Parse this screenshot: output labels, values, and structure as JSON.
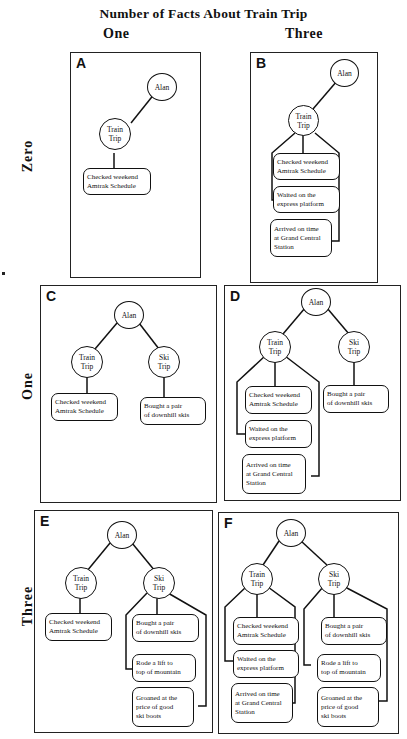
{
  "figure": {
    "title": "Number of Facts About Train Trip",
    "column_labels": [
      "One",
      "Three"
    ],
    "row_labels": [
      "Zero",
      "One",
      "Three"
    ]
  },
  "nodes": {
    "person": "Alan",
    "train": "Train\nTrip",
    "ski": "Ski\nTrip",
    "train_facts": [
      "Checked weekend\nAmtrak Schedule",
      "Waited on the\nexpress platform",
      "Arrived on time\nat Grand Central\nStation"
    ],
    "ski_facts": [
      "Bought a pair\nof downhill skis",
      "Rode a lift to\ntop of mountain",
      "Groaned at the\nprice of good\nski boots"
    ]
  },
  "panels": [
    {
      "letter": "A",
      "train_facts": 1,
      "ski_facts": 0
    },
    {
      "letter": "B",
      "train_facts": 3,
      "ski_facts": 0
    },
    {
      "letter": "C",
      "train_facts": 1,
      "ski_facts": 1
    },
    {
      "letter": "D",
      "train_facts": 3,
      "ski_facts": 1
    },
    {
      "letter": "E",
      "train_facts": 1,
      "ski_facts": 3
    },
    {
      "letter": "F",
      "train_facts": 3,
      "ski_facts": 3
    }
  ]
}
